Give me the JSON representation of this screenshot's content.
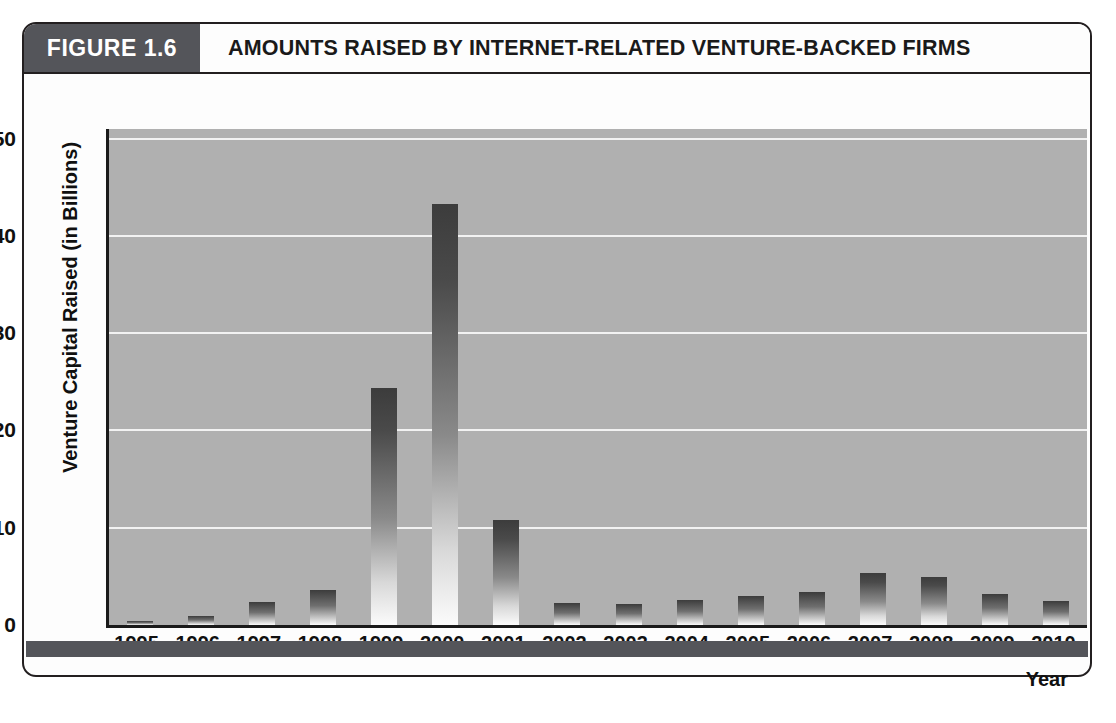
{
  "figure": {
    "tag": "FIGURE 1.6",
    "title": "AMOUNTS RAISED BY INTERNET-RELATED VENTURE-BACKED FIRMS"
  },
  "colors": {
    "tag_background": "#54555a",
    "plot_background": "#b0b0b0",
    "gridline": "#f2f2f2",
    "axis": "#1a1a1a",
    "bar_top": "#3c3c3c",
    "bar_bottom": "#fbfbfb",
    "page_background": "#ffffff"
  },
  "chart_data": {
    "type": "bar",
    "title": "AMOUNTS RAISED BY INTERNET-RELATED VENTURE-BACKED FIRMS",
    "xlabel": "Year",
    "ylabel": "Venture Capital Raised (in Billions)",
    "categories": [
      "1995",
      "1996",
      "1997",
      "1998",
      "1999",
      "2000",
      "2001",
      "2002",
      "2003",
      "2004",
      "2005",
      "2006",
      "2007",
      "2008",
      "2009",
      "2010"
    ],
    "values": [
      0.4,
      0.9,
      2.4,
      3.6,
      24.4,
      43.3,
      10.8,
      2.3,
      2.2,
      2.6,
      3.0,
      3.4,
      5.3,
      4.9,
      3.2,
      2.5
    ],
    "ylim": [
      0,
      51
    ],
    "yticks": [
      0,
      10,
      20,
      30,
      40,
      50
    ],
    "ytick_labels": [
      "0",
      "10",
      "20",
      "30",
      "40",
      "50"
    ],
    "grid": true,
    "legend": null
  }
}
